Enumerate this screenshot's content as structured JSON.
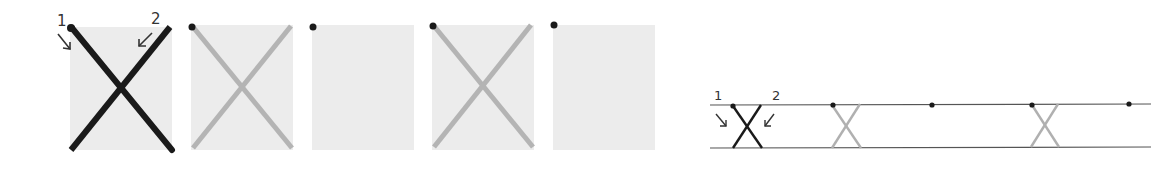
{
  "figure": {
    "left_panels": [
      {
        "id": 1,
        "x": 70,
        "cross": "dark",
        "dot": true
      },
      {
        "id": 2,
        "x": 191,
        "cross": "light",
        "dot": true
      },
      {
        "id": 3,
        "x": 312,
        "cross": "none",
        "dot": true
      },
      {
        "id": 4,
        "x": 432,
        "cross": "light",
        "dot": true
      },
      {
        "id": 5,
        "x": 553,
        "cross": "none",
        "dot": true
      }
    ],
    "labels": {
      "stroke_1": "1",
      "stroke_2": "2",
      "strip_stroke_1": "1",
      "strip_stroke_2": "2"
    },
    "strip": {
      "marks": [
        {
          "x": 734,
          "type": "dark-x"
        },
        {
          "x": 832,
          "type": "light-x"
        },
        {
          "x": 932,
          "type": "dot"
        },
        {
          "x": 1031,
          "type": "light-x"
        },
        {
          "x": 1129,
          "type": "dot"
        }
      ]
    },
    "colors": {
      "dark": "#1a1a1a",
      "light": "#b4b4b4",
      "panel_bg": "#ececec",
      "line": "#444444"
    }
  }
}
